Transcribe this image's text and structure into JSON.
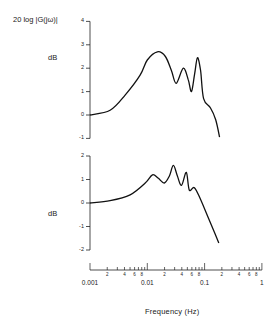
{
  "chart_data": [
    {
      "type": "line",
      "title": "",
      "ylabel_top": "20 log |G(jω)|",
      "ylabel": "dB",
      "xlabel": "Frequency (Hz)",
      "xscale": "log",
      "xlim": [
        0.001,
        1
      ],
      "ylim": [
        -1,
        4
      ],
      "yticks": [
        -1,
        0,
        1,
        2,
        3,
        4
      ],
      "grid": false,
      "series": [
        {
          "name": "upper response",
          "x": [
            0.001,
            0.00224,
            0.0041,
            0.0075,
            0.01,
            0.015,
            0.0207,
            0.0263,
            0.032,
            0.0425,
            0.052,
            0.059,
            0.067,
            0.075,
            0.085,
            0.096,
            0.127,
            0.156,
            0.183
          ],
          "y": [
            0,
            0.2,
            0.85,
            1.7,
            2.35,
            2.7,
            2.5,
            1.9,
            1.35,
            2.0,
            1.5,
            1.0,
            1.75,
            2.45,
            1.9,
            0.7,
            0.3,
            -0.2,
            -0.95
          ]
        }
      ]
    },
    {
      "type": "line",
      "title": "",
      "ylabel": "dB",
      "xlabel": "Frequency (Hz)",
      "xscale": "log",
      "xlim": [
        0.001,
        1
      ],
      "ylim": [
        -2,
        2
      ],
      "yticks": [
        -2,
        -1,
        0,
        1,
        2
      ],
      "grid": false,
      "series": [
        {
          "name": "lower response",
          "x": [
            0.001,
            0.00224,
            0.005,
            0.0092,
            0.0123,
            0.0156,
            0.0198,
            0.0243,
            0.0285,
            0.0335,
            0.0395,
            0.048,
            0.054,
            0.0665,
            0.085,
            0.117,
            0.149,
            0.177
          ],
          "y": [
            0,
            0.1,
            0.35,
            0.85,
            1.2,
            1.05,
            0.85,
            1.15,
            1.6,
            1.15,
            0.75,
            1.3,
            0.55,
            0.65,
            0.15,
            -0.65,
            -1.25,
            -1.7
          ]
        }
      ]
    }
  ],
  "labels": {
    "top_ylabel": "20 log |G(jω)|",
    "dB_top": "dB",
    "dB_bottom": "dB",
    "xtitle": "Frequency (Hz)"
  },
  "axis": {
    "top_yticks": [
      "4",
      "3",
      "2",
      "1",
      "0",
      "-1"
    ],
    "bottom_yticks": [
      "2",
      "1",
      "0",
      "-1",
      "-2"
    ],
    "x_decades": [
      "0.001",
      "0.01",
      "0.1",
      "1"
    ],
    "x_minor_labels": [
      "2",
      "4",
      "6",
      "8"
    ]
  }
}
